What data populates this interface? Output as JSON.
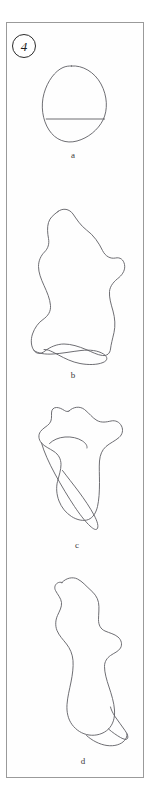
{
  "figure": {
    "number_label": "4",
    "number_icon": "circled-number-badge",
    "background_color": "#ffffff",
    "frame_color": "#9a9a9a",
    "ink_color": "#5d5d63"
  },
  "shapes": [
    {
      "id": "a",
      "label": "a",
      "icon": "ellipse-with-chord-icon",
      "description": "tilted ellipse with horizontal chord",
      "self_intersecting": false
    },
    {
      "id": "b",
      "label": "b",
      "icon": "blob-curve-with-bottom-loop-icon",
      "description": "large irregular blob with self-crossing loop at bottom",
      "self_intersecting": true
    },
    {
      "id": "c",
      "label": "c",
      "icon": "blob-curve-with-tail-loop-icon",
      "description": "irregular blob with looping tail crossing itself",
      "self_intersecting": true
    },
    {
      "id": "d",
      "label": "d",
      "icon": "elongated-blob-with-bottom-loop-icon",
      "description": "elongated bulb shape with small loop at the bottom",
      "self_intersecting": true
    }
  ]
}
